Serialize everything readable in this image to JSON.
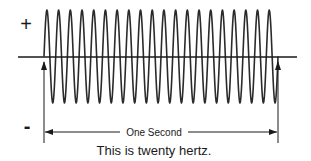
{
  "diagram": {
    "type": "waveform",
    "positive_label": "+",
    "negative_label": "-",
    "interval_label": "One Second",
    "caption": "This is twenty hertz.",
    "cycles": 20,
    "frequency_hz": 20,
    "duration_s": 1,
    "colors": {
      "line": "#1a1a1a",
      "wave": "#2b2b2b",
      "background": "#ffffff"
    },
    "geometry": {
      "axis_y": 57,
      "axis_x_start": 18,
      "axis_x_end": 297,
      "wave_x_start": 44,
      "wave_x_end": 278,
      "peak_y": 10,
      "trough_y": 103,
      "marker_top_y": 62,
      "marker_bottom_y": 143,
      "dimension_y": 132,
      "plus_x": 26,
      "plus_y": 31,
      "minus_x": 27,
      "minus_y": 133,
      "interval_label_x": 154,
      "interval_label_y": 136,
      "caption_x": 154,
      "caption_y": 155
    }
  }
}
